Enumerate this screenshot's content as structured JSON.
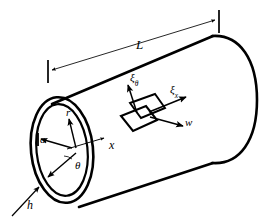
{
  "figure": {
    "type": "engineering-line-diagram",
    "background_color": "#ffffff",
    "line_color": "#000000",
    "width": 268,
    "height": 224
  },
  "labels": {
    "length": "L",
    "radius": "a",
    "radial_coord": "r",
    "circumferential_angle": "θ",
    "axial_coord": "x",
    "thickness": "h",
    "normal_displacement": "w",
    "xi_symbol": "ξ",
    "xi_theta_sub": "θ",
    "xi_x_sub": "x"
  },
  "geometry": {
    "cylinder": {
      "near_end_ellipse_outer": {
        "cx": 62,
        "cy": 150,
        "rx": 31,
        "ry": 53,
        "rotation_deg": -6
      },
      "near_end_ellipse_inner": {
        "cx": 62,
        "cy": 150,
        "rx": 26,
        "ry": 46,
        "rotation_deg": -6
      },
      "top_edge": {
        "x1": 52,
        "y1": 104,
        "x2": 212,
        "y2": 36
      },
      "bottom_edge": {
        "x1": 78,
        "y1": 207,
        "x2": 212,
        "y2": 163
      },
      "far_end_arc_top": {
        "x": 212,
        "y": 36
      },
      "far_end_arc_bottom": {
        "x": 212,
        "y": 163
      },
      "far_end_bulge_x": 258
    },
    "dimension_line_L": {
      "left_tick": {
        "x": 48,
        "y1": 60,
        "y2": 82
      },
      "right_tick": {
        "x": 219,
        "y1": 11,
        "y2": 33
      },
      "arrow_left_at": {
        "x": 50,
        "y": 70
      },
      "arrow_right_at": {
        "x": 217,
        "y": 20
      }
    },
    "element_patch": {
      "front_face": [
        [
          122,
          116
        ],
        [
          146,
          105
        ],
        [
          158,
          119
        ],
        [
          134,
          131
        ]
      ],
      "back_face": [
        [
          130,
          104
        ],
        [
          154,
          95
        ],
        [
          164,
          108
        ],
        [
          141,
          118
        ]
      ]
    },
    "vectors": {
      "x_axis": {
        "from": [
          66,
          148
        ],
        "to": [
          106,
          138
        ]
      },
      "r_axis": {
        "from": [
          76,
          148
        ],
        "to": [
          68,
          118
        ]
      },
      "a_line": {
        "from": [
          72,
          148
        ],
        "to": [
          42,
          138
        ]
      },
      "theta_arc": {
        "from": [
          76,
          152
        ],
        "to": [
          47,
          177
        ]
      },
      "h_leader": {
        "from": [
          14,
          213
        ],
        "to": [
          40,
          186
        ]
      },
      "xi_theta": {
        "from": [
          136,
          112
        ],
        "to": [
          128,
          84
        ]
      },
      "xi_x": {
        "from": [
          150,
          112
        ],
        "to": [
          185,
          97
        ]
      },
      "w": {
        "from": [
          150,
          116
        ],
        "to": [
          183,
          125
        ]
      }
    }
  },
  "label_positions": {
    "L": {
      "x": 136,
      "y": 38
    },
    "a": {
      "x": 40,
      "y": 141
    },
    "r": {
      "x": 66,
      "y": 114
    },
    "theta": {
      "x": 74,
      "y": 166
    },
    "x": {
      "x": 110,
      "y": 144
    },
    "h": {
      "x": 27,
      "y": 205
    },
    "w": {
      "x": 186,
      "y": 122
    },
    "xi_theta": {
      "x": 131,
      "y": 78
    },
    "xi_x": {
      "x": 171,
      "y": 90
    }
  }
}
